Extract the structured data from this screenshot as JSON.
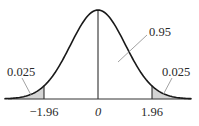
{
  "chart_data": {
    "type": "area",
    "title": "",
    "xlabel": "",
    "ylabel": "",
    "x_ticks": [
      "−1.96",
      "0",
      "1.96"
    ],
    "x_tick_values": [
      -1.96,
      0,
      1.96
    ],
    "xlim": [
      -3.4,
      3.4
    ],
    "grid": false,
    "legend": null,
    "series": [
      {
        "name": "standard normal density",
        "mean": 0,
        "sd": 1
      }
    ],
    "regions": [
      {
        "name": "left-tail",
        "from": -3.4,
        "to": -1.96,
        "probability": 0.025,
        "shaded": true
      },
      {
        "name": "center",
        "from": -1.96,
        "to": 1.96,
        "probability": 0.95,
        "shaded": false
      },
      {
        "name": "right-tail",
        "from": 1.96,
        "to": 3.4,
        "probability": 0.025,
        "shaded": true
      }
    ],
    "annotations": [
      {
        "text": "0.025",
        "target": "left-tail"
      },
      {
        "text": "0.95",
        "target": "center"
      },
      {
        "text": "0.025",
        "target": "right-tail"
      }
    ]
  },
  "labels": {
    "left_tail": "0.025",
    "center": "0.95",
    "right_tail": "0.025",
    "tick_left": "−1.96",
    "tick_center": "0",
    "tick_right": "1.96"
  },
  "colors": {
    "curve": "#1a1a1a",
    "shade": "#d4d4d4",
    "axis": "#333333",
    "leader": "#8a8a8a"
  }
}
